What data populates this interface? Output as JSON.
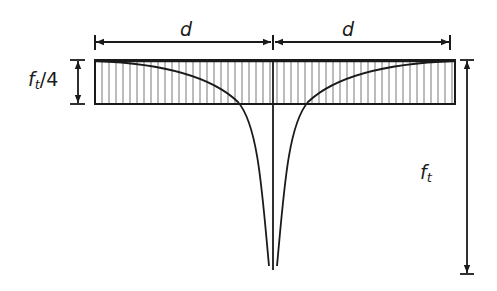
{
  "diagram": {
    "type": "stress-distribution",
    "labels": {
      "dim_left": "d",
      "dim_right": "d",
      "quarter_stress_main": "f",
      "quarter_stress_sub": "t",
      "quarter_stress_suffix": "/4",
      "peak_stress_main": "f",
      "peak_stress_sub": "t"
    },
    "geometry": {
      "rect": {
        "x1": 95,
        "y1": 60,
        "x2": 455,
        "y2": 104
      },
      "center_x": 273,
      "dim_line_y": 42,
      "peak_y": 268,
      "hatch_spacing": 7
    },
    "colors": {
      "line": "#1a1a1a",
      "hatch": "#555555",
      "background": "#ffffff"
    }
  }
}
